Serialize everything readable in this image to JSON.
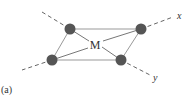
{
  "figure": {
    "panel_label": "(a)",
    "center_label": "M",
    "axis_x_label": "x",
    "axis_y_label": "y",
    "atom_color": "#555555",
    "bond_color": "#888888",
    "axis_color": "#666666"
  }
}
